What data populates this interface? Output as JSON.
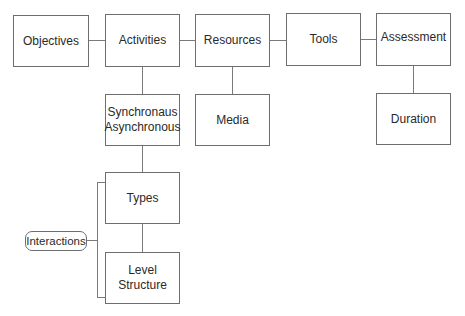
{
  "diagram": {
    "top_row": [
      {
        "id": "objectives",
        "label": "Objectives"
      },
      {
        "id": "activities",
        "label": "Activities"
      },
      {
        "id": "resources",
        "label": "Resources"
      },
      {
        "id": "tools",
        "label": "Tools"
      },
      {
        "id": "assessment",
        "label": "Assessment"
      }
    ],
    "children": {
      "activities": {
        "label": "Synchronaus\nAsynchronous"
      },
      "resources": {
        "label": "Media"
      },
      "assessment": {
        "label": "Duration"
      }
    },
    "interactions_group": {
      "label": "Interactions",
      "items": [
        {
          "id": "types",
          "label": "Types"
        },
        {
          "id": "level_structure",
          "label": "Level\nStructure"
        }
      ]
    },
    "colors": {
      "border": "#6e6e6e",
      "line": "#7a7a7a",
      "text": "#2a2a2a",
      "background": "#ffffff"
    }
  }
}
